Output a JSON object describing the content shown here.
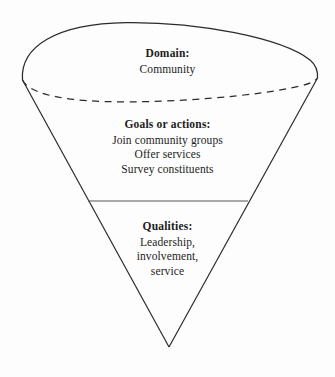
{
  "figure": {
    "shape": "inverted-cone",
    "colors": {
      "background": "#fdfdfd",
      "outline": "#2b2b2b",
      "divider": "#555555",
      "text": "#1c1c1c"
    },
    "sections": [
      {
        "id": "domain",
        "heading": "Domain:",
        "lines": [
          "Community"
        ]
      },
      {
        "id": "goals",
        "heading": "Goals or actions:",
        "lines": [
          "Join community groups",
          "Offer services",
          "Survey constituents"
        ]
      },
      {
        "id": "qualities",
        "heading": "Qualities:",
        "lines": [
          "Leadership,",
          "involvement,",
          "service"
        ]
      }
    ]
  }
}
